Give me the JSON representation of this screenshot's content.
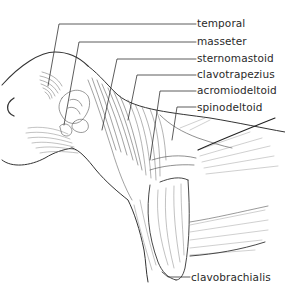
{
  "figure": {
    "line_color": "#333333",
    "background": "#ffffff"
  },
  "labels": [
    {
      "id": "temporal",
      "text": "temporal"
    },
    {
      "id": "masseter",
      "text": "masseter"
    },
    {
      "id": "sternomastoid",
      "text": "sternomastoid"
    },
    {
      "id": "clavotrapezius",
      "text": "clavotrapezius"
    },
    {
      "id": "acromiodeltoid",
      "text": "acromiodeltoid"
    },
    {
      "id": "spinodeltoid",
      "text": "spinodeltoid"
    },
    {
      "id": "clavobrachialis",
      "text": "clavobrachialis"
    }
  ]
}
